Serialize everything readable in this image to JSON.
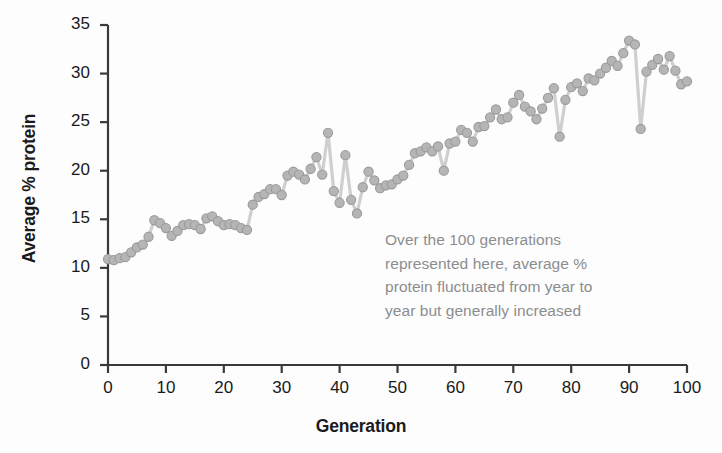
{
  "chart_data": {
    "type": "line",
    "title": "",
    "subtitle": "",
    "xlabel": "Generation",
    "ylabel": "Average % protein",
    "xlim": [
      0,
      100
    ],
    "ylim": [
      0,
      35
    ],
    "xticks": [
      0,
      10,
      20,
      30,
      40,
      50,
      60,
      70,
      80,
      90,
      100
    ],
    "yticks": [
      0,
      5,
      10,
      15,
      20,
      25,
      30,
      35
    ],
    "grid": false,
    "legend": "none",
    "marker": "circle",
    "marker_color": "#b5b5b5",
    "marker_edge_color": "#9a9a9a",
    "line_color": "#cfcfcf",
    "axis_color": "#3a3a3a",
    "annotations": [
      {
        "name": "trend-note",
        "color": "#8b8d8f",
        "lines": [
          "Over the 100 generations",
          "represented here, average %",
          "protein fluctuated from year to",
          "year but generally increased"
        ]
      }
    ],
    "series": [
      {
        "name": "Average % protein",
        "x": [
          0,
          1,
          2,
          3,
          4,
          5,
          6,
          7,
          8,
          9,
          10,
          11,
          12,
          13,
          14,
          15,
          16,
          17,
          18,
          19,
          20,
          21,
          22,
          23,
          24,
          25,
          26,
          27,
          28,
          29,
          30,
          31,
          32,
          33,
          34,
          35,
          36,
          37,
          38,
          39,
          40,
          41,
          42,
          43,
          44,
          45,
          46,
          47,
          48,
          49,
          50,
          51,
          52,
          53,
          54,
          55,
          56,
          57,
          58,
          59,
          60,
          61,
          62,
          63,
          64,
          65,
          66,
          67,
          68,
          69,
          70,
          71,
          72,
          73,
          74,
          75,
          76,
          77,
          78,
          79,
          80,
          81,
          82,
          83,
          84,
          85,
          86,
          87,
          88,
          89,
          90,
          91,
          92,
          93,
          94,
          95,
          96,
          97,
          98,
          99,
          100
        ],
        "values": [
          10.9,
          10.8,
          11.0,
          11.1,
          11.6,
          12.1,
          12.4,
          13.2,
          14.9,
          14.6,
          14.1,
          13.3,
          13.8,
          14.4,
          14.5,
          14.4,
          14.0,
          15.1,
          15.3,
          14.8,
          14.4,
          14.5,
          14.4,
          14.1,
          13.9,
          16.5,
          17.3,
          17.6,
          18.1,
          18.1,
          17.5,
          19.5,
          19.9,
          19.6,
          19.1,
          20.2,
          21.4,
          19.6,
          23.9,
          17.9,
          16.7,
          21.6,
          17.0,
          15.6,
          18.3,
          19.9,
          19.0,
          18.2,
          18.5,
          18.6,
          19.1,
          19.5,
          20.6,
          21.8,
          22.0,
          22.4,
          22.0,
          22.5,
          20.0,
          22.8,
          23.0,
          24.2,
          23.9,
          23.0,
          24.5,
          24.6,
          25.5,
          26.3,
          25.3,
          25.5,
          27.0,
          27.8,
          26.6,
          26.1,
          25.3,
          26.4,
          27.5,
          28.5,
          23.5,
          27.3,
          28.6,
          29.0,
          28.2,
          29.5,
          29.3,
          30.0,
          30.6,
          31.3,
          30.8,
          32.1,
          33.4,
          33.0,
          24.3,
          30.2,
          30.9,
          31.5,
          30.4,
          31.8,
          30.3,
          28.9,
          29.2
        ]
      }
    ]
  },
  "geometry": {
    "plot_left": 108,
    "plot_right": 687,
    "plot_top": 25,
    "plot_bottom": 365
  }
}
